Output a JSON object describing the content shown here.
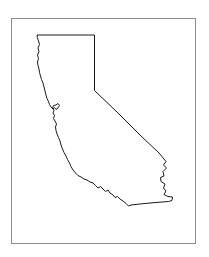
{
  "figure": {
    "title": "California state outline map",
    "type": "outline-map",
    "canvas": {
      "width": 209,
      "height": 257,
      "background_color": "#ffffff"
    },
    "frame": {
      "name": "border-frame",
      "x": 11,
      "y": 18,
      "width": 184,
      "height": 225,
      "stroke_color": "#8c8c8c",
      "fill_color": "#ffffff",
      "stroke_width": 1
    },
    "state": {
      "name": "California",
      "outline_color": "#1a1a1a",
      "fill_color": "#ffffff",
      "stroke_width": 1,
      "path": "M 37.5,35.0 L 94.5,35.0 L 94.5,90.5 L 118.0,113.0 L 140.0,135.0 L 159.0,153.0 L 166.0,161.5 L 163.5,165.0 L 166.5,168.0 L 163.0,171.5 L 164.0,176.0 L 160.5,177.5 L 161.0,181.5 L 165.0,184.0 L 163.5,188.0 L 166.0,191.0 L 164.0,194.5 L 168.0,196.5 L 172.5,197.0 L 172.0,200.5 L 168.5,201.5 L 162.0,202.0 L 150.0,203.0 L 140.0,204.0 L 131.0,205.0 L 128.5,206.0 L 126.0,203.5 L 123.0,201.0 L 120.0,199.0 L 117.5,196.5 L 115.0,197.5 L 113.0,195.0 L 110.0,193.0 L 108.0,190.0 L 105.5,191.5 L 103.0,189.0 L 100.5,186.5 L 98.0,188.0 L 95.5,185.5 L 93.0,183.0 L 90.0,182.0 L 87.0,180.0 L 84.0,179.0 L 81.0,177.0 L 78.0,175.5 L 75.5,173.0 L 73.0,170.0 L 71.0,166.5 L 69.5,163.0 L 67.5,159.5 L 66.0,156.0 L 64.0,152.5 L 62.5,149.0 L 61.0,145.0 L 60.0,141.0 L 58.5,137.5 L 57.0,134.0 L 56.0,130.5 L 55.5,127.0 L 56.5,124.0 L 55.0,121.0 L 53.5,118.5 L 54.5,115.5 L 53.0,113.0 L 54.0,110.5 L 52.5,108.0 L 53.5,105.5 L 56.0,105.0 L 58.0,103.5 L 59.5,105.5 L 58.0,108.0 L 56.0,109.5 L 54.5,107.5 L 53.0,109.0 L 51.0,107.0 L 49.5,104.5 L 48.5,101.5 L 47.0,98.5 L 46.0,95.0 L 45.0,91.0 L 44.0,87.0 L 43.0,83.0 L 41.5,79.5 L 40.5,76.0 L 39.5,72.5 L 39.0,69.0 L 38.0,65.5 L 37.5,62.0 L 38.5,58.5 L 37.5,55.0 L 39.0,51.5 L 38.0,48.0 L 39.5,44.5 L 38.5,41.0 L 37.5,38.0 Z",
      "regions": [
        {
          "name": "highlighted-region",
          "label": "",
          "shape": "rectangle",
          "x": 48,
          "y": 76,
          "width": 22,
          "height": 29,
          "fill_color": "#e4e4e4"
        }
      ]
    },
    "labels": [],
    "legend": null
  }
}
